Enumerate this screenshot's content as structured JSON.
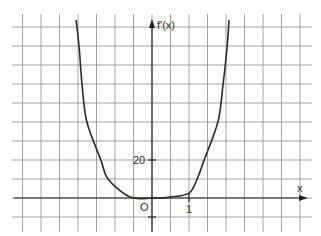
{
  "chart_data": {
    "type": "line",
    "title": "",
    "xlabel": "x",
    "ylabel": "f'(x)",
    "origin_label": "O",
    "x_tick_labels": [
      {
        "value": 1,
        "label": "1"
      }
    ],
    "y_tick_labels": [
      {
        "value": 20,
        "label": "20"
      }
    ],
    "grid": true,
    "grid_step": {
      "x": 0.5,
      "y": 10
    },
    "xlim": [
      -3.5,
      4.2
    ],
    "ylim": [
      -15,
      95
    ],
    "legend": null,
    "series": [
      {
        "name": "f'(x)",
        "x": [
          -2.05,
          -1.97,
          -1.89,
          -1.76,
          -1.38,
          -1.19,
          -0.59,
          0,
          0.49,
          1.0,
          1.22,
          1.41,
          1.78,
          1.92,
          2.03,
          2.08
        ],
        "y": [
          93.7,
          79.5,
          59.5,
          40,
          20,
          10,
          0.5,
          0,
          0.5,
          2.6,
          10,
          20,
          40,
          59.5,
          79.5,
          93.7
        ]
      }
    ]
  },
  "labels": {
    "y_axis": "f'(x)",
    "x_axis": "x",
    "origin": "O",
    "tick_x_1": "1",
    "tick_y_20": "20"
  }
}
